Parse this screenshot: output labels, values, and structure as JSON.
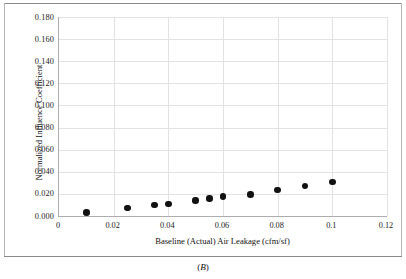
{
  "caption": {
    "prefix": "(",
    "letter": "B",
    "suffix": ")"
  },
  "chart_data": {
    "type": "scatter",
    "title": "",
    "xlabel": "Baseline (Actual) Air Leakage (cfm/sf)",
    "ylabel": "Normalized Influence Coefficient",
    "xlim": [
      0,
      0.12
    ],
    "ylim": [
      0,
      0.18
    ],
    "grid": true,
    "legend": "none",
    "marker": {
      "shape": "circle",
      "color": "#111111",
      "size_px": 6.4
    },
    "xticks": [
      0,
      0.02,
      0.04,
      0.06,
      0.08,
      0.1,
      0.12
    ],
    "xtick_labels": [
      "0",
      "0.02",
      "0.04",
      "0.06",
      "0.08",
      "0.1",
      "0.12"
    ],
    "yticks": [
      0,
      0.02,
      0.04,
      0.06,
      0.08,
      0.1,
      0.12,
      0.14,
      0.16,
      0.18
    ],
    "ytick_labels": [
      "0.000",
      "0.020",
      "0.040",
      "0.060",
      "0.080",
      "0.100",
      "0.120",
      "0.140",
      "0.160",
      "0.180"
    ],
    "x": [
      0.01,
      0.025,
      0.035,
      0.04,
      0.05,
      0.055,
      0.06,
      0.07,
      0.08,
      0.09,
      0.1
    ],
    "y": [
      0.003,
      0.007,
      0.01,
      0.011,
      0.014,
      0.016,
      0.0175,
      0.0195,
      0.0235,
      0.027,
      0.031
    ],
    "points": [
      {
        "x": 0.01,
        "y": 0.003
      },
      {
        "x": 0.025,
        "y": 0.007
      },
      {
        "x": 0.035,
        "y": 0.01
      },
      {
        "x": 0.04,
        "y": 0.011
      },
      {
        "x": 0.05,
        "y": 0.014
      },
      {
        "x": 0.055,
        "y": 0.016
      },
      {
        "x": 0.06,
        "y": 0.0175
      },
      {
        "x": 0.07,
        "y": 0.0195
      },
      {
        "x": 0.08,
        "y": 0.0235
      },
      {
        "x": 0.09,
        "y": 0.027
      },
      {
        "x": 0.1,
        "y": 0.031
      }
    ]
  }
}
